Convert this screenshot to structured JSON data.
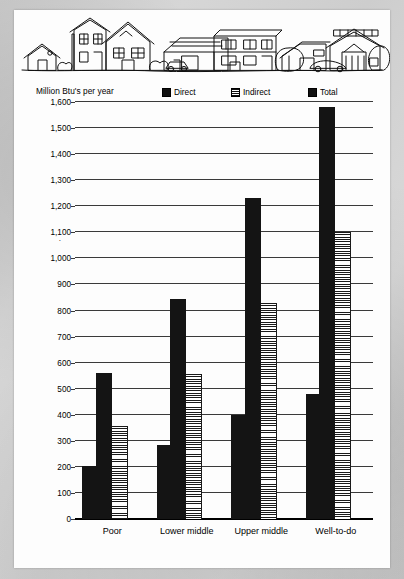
{
  "figure": {
    "illustration_alt": "neighborhood-houses-line-art"
  },
  "legend": {
    "items": [
      {
        "label": "Direct",
        "swatch": "solid-black-swatch"
      },
      {
        "label": "Indirect",
        "swatch": "horizontal-stripes-swatch"
      },
      {
        "label": "Total",
        "swatch": "solid-black-swatch"
      }
    ]
  },
  "chart_data": {
    "type": "bar",
    "title": "",
    "ylabel": "Million Btu's per year",
    "xlabel": "",
    "ylim": [
      0,
      1600
    ],
    "ytick_step": 100,
    "grid": true,
    "legend_position": "top",
    "categories": [
      "Poor",
      "Lower middle",
      "Upper middle",
      "Well-to-do"
    ],
    "ytick_labels": [
      "1,600",
      "1,500",
      "1,400",
      "1,300",
      "1,200",
      "1,100",
      "1,000",
      "900",
      "800",
      "700",
      "600",
      "500",
      "400",
      "300",
      "200",
      "100",
      "0"
    ],
    "ytick_values": [
      1600,
      1500,
      1400,
      1300,
      1200,
      1100,
      1000,
      900,
      800,
      700,
      600,
      500,
      400,
      300,
      200,
      100,
      0
    ],
    "series": [
      {
        "name": "Direct",
        "values": [
          205,
          285,
          400,
          480
        ]
      },
      {
        "name": "Indirect",
        "values": [
          355,
          555,
          830,
          1100
        ]
      },
      {
        "name": "Total",
        "values": [
          560,
          845,
          1230,
          1580
        ]
      }
    ]
  }
}
